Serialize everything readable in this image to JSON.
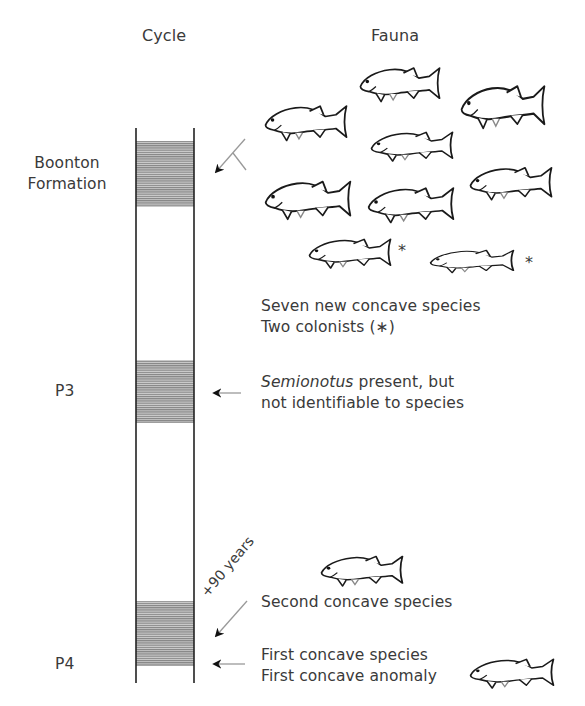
{
  "headers": {
    "cycle": "Cycle",
    "fauna": "Fauna"
  },
  "cycles": [
    {
      "line1": "Boonton",
      "line2": "Formation"
    },
    {
      "label": "P3"
    },
    {
      "label": "P4"
    }
  ],
  "annotations": {
    "boonton": {
      "line1": "Seven new concave species",
      "line2": "Two colonists (∗)"
    },
    "p3": {
      "genus": "Semionotus",
      "line1_rest": " present, but",
      "line2": "not identifiable to species"
    },
    "p4_upper": {
      "line1": "Second concave species"
    },
    "p4_lower": {
      "line1": "First concave species",
      "line2": "First concave anomaly"
    },
    "time_gap": "+90 years"
  },
  "markers": {
    "colonist_star_1": "*",
    "colonist_star_2": "*"
  },
  "colors": {
    "line": "#222222",
    "band": "#9a9a9a",
    "text": "#3a3a3a",
    "arrow_gray": "#888888"
  }
}
